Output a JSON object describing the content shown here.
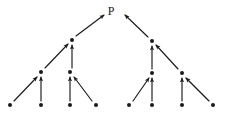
{
  "diagram": {
    "type": "directed-tree",
    "title": "P",
    "width": 244,
    "height": 124,
    "background_color": "#ffffff",
    "ink_color": "#1a1a1a",
    "root_label": {
      "text": "P",
      "x": 111,
      "y": 11
    },
    "nodes": [
      {
        "id": "L1a",
        "label": "",
        "x": 72,
        "y": 40,
        "level": 1,
        "radius": 2.0
      },
      {
        "id": "L1b",
        "label": "",
        "x": 152,
        "y": 41,
        "level": 1,
        "radius": 2.0
      },
      {
        "id": "L2a",
        "label": "",
        "x": 41,
        "y": 72,
        "level": 2,
        "radius": 2.0
      },
      {
        "id": "L2b",
        "label": "",
        "x": 70,
        "y": 72,
        "level": 2,
        "radius": 2.0
      },
      {
        "id": "L2c",
        "label": "",
        "x": 152,
        "y": 73,
        "level": 2,
        "radius": 2.0
      },
      {
        "id": "L2d",
        "label": "",
        "x": 182,
        "y": 73,
        "level": 2,
        "radius": 2.0
      },
      {
        "id": "L3a",
        "label": "",
        "x": 10,
        "y": 105,
        "level": 3,
        "radius": 2.0
      },
      {
        "id": "L3b",
        "label": "",
        "x": 41,
        "y": 105,
        "level": 3,
        "radius": 2.0
      },
      {
        "id": "L3c",
        "label": "",
        "x": 70,
        "y": 105,
        "level": 3,
        "radius": 2.0
      },
      {
        "id": "L3d",
        "label": "",
        "x": 96,
        "y": 105,
        "level": 3,
        "radius": 2.0
      },
      {
        "id": "L3e",
        "label": "",
        "x": 129,
        "y": 105,
        "level": 3,
        "radius": 2.0
      },
      {
        "id": "L3f",
        "label": "",
        "x": 152,
        "y": 105,
        "level": 3,
        "radius": 2.0
      },
      {
        "id": "L3g",
        "label": "",
        "x": 182,
        "y": 105,
        "level": 3,
        "radius": 2.0
      },
      {
        "id": "L3h",
        "label": "",
        "x": 213,
        "y": 105,
        "level": 3,
        "radius": 2.0
      }
    ],
    "edges": [
      {
        "id": "e1",
        "from": "L1a",
        "to": "P",
        "x1": 76,
        "y1": 36,
        "x2": 104,
        "y2": 15,
        "arrow": "end"
      },
      {
        "id": "e2",
        "from": "L1b",
        "to": "P",
        "x1": 148,
        "y1": 37,
        "x2": 125,
        "y2": 15,
        "arrow": "end"
      },
      {
        "id": "e3",
        "from": "L2a",
        "to": "L1a",
        "x1": 45,
        "y1": 68,
        "x2": 68,
        "y2": 44,
        "arrow": "end"
      },
      {
        "id": "e4",
        "from": "L2b",
        "to": "L1a",
        "x1": 72,
        "y1": 68,
        "x2": 72,
        "y2": 45,
        "arrow": "end"
      },
      {
        "id": "e5",
        "from": "L2c",
        "to": "L1b",
        "x1": 152,
        "y1": 69,
        "x2": 152,
        "y2": 46,
        "arrow": "end"
      },
      {
        "id": "e6",
        "from": "L2d",
        "to": "L1b",
        "x1": 178,
        "y1": 69,
        "x2": 156,
        "y2": 45,
        "arrow": "end"
      },
      {
        "id": "e7",
        "from": "L3a",
        "to": "L2a",
        "x1": 14,
        "y1": 101,
        "x2": 37,
        "y2": 77,
        "arrow": "end"
      },
      {
        "id": "e8",
        "from": "L3b",
        "to": "L2a",
        "x1": 41,
        "y1": 101,
        "x2": 41,
        "y2": 77,
        "arrow": "end"
      },
      {
        "id": "e9",
        "from": "L3c",
        "to": "L2b",
        "x1": 70,
        "y1": 101,
        "x2": 70,
        "y2": 77,
        "arrow": "end"
      },
      {
        "id": "e10",
        "from": "L3d",
        "to": "L2b",
        "x1": 92,
        "y1": 101,
        "x2": 74,
        "y2": 77,
        "arrow": "end"
      },
      {
        "id": "e11",
        "from": "L3e",
        "to": "L2c",
        "x1": 133,
        "y1": 101,
        "x2": 149,
        "y2": 78,
        "arrow": "end"
      },
      {
        "id": "e12",
        "from": "L3f",
        "to": "L2c",
        "x1": 152,
        "y1": 101,
        "x2": 152,
        "y2": 78,
        "arrow": "end"
      },
      {
        "id": "e13",
        "from": "L3g",
        "to": "L2d",
        "x1": 182,
        "y1": 101,
        "x2": 182,
        "y2": 78,
        "arrow": "end"
      },
      {
        "id": "e14",
        "from": "L3h",
        "to": "L2d",
        "x1": 209,
        "y1": 101,
        "x2": 186,
        "y2": 78,
        "arrow": "end"
      }
    ]
  }
}
